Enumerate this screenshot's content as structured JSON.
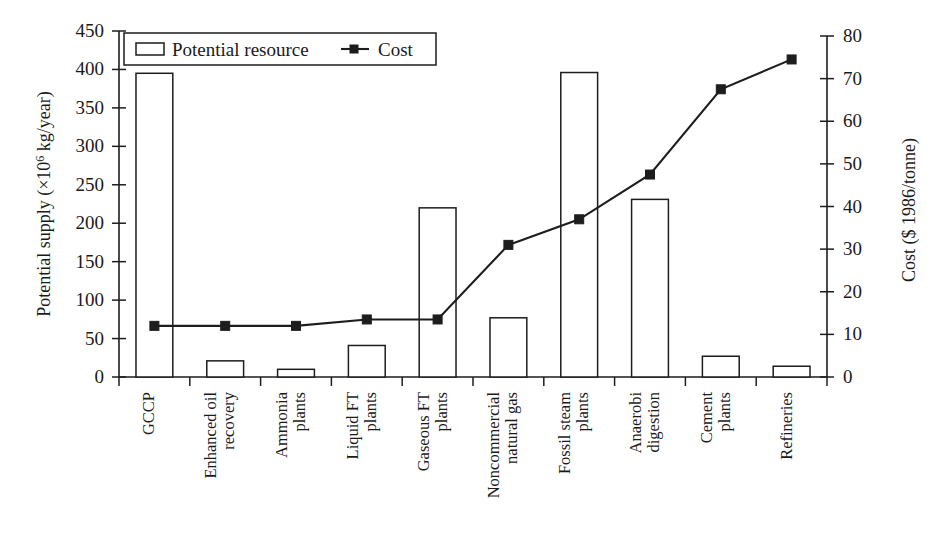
{
  "chart_data": {
    "type": "bar",
    "title": "",
    "subtitle": "",
    "categories": [
      "GCCP",
      "Enhanced oil recovery",
      "Ammonia plants",
      "Liquid FT plants",
      "Gaseous FT plants",
      "Noncommercial natural gas",
      "Fossil steam plants",
      "Anaerobi digestion",
      "Cement plants",
      "Refineries"
    ],
    "category_lines": [
      [
        "GCCP"
      ],
      [
        "Enhanced oil",
        "recovery"
      ],
      [
        "Ammonia",
        "plants"
      ],
      [
        "Liquid FT",
        "plants"
      ],
      [
        "Gaseous FT",
        "plants"
      ],
      [
        "Noncommercial",
        "natural gas"
      ],
      [
        "Fossil steam",
        "plants"
      ],
      [
        "Anaerobi",
        "digestion"
      ],
      [
        "Cement",
        "plants"
      ],
      [
        "Refineries"
      ]
    ],
    "series": [
      {
        "name": "Potential resource",
        "kind": "bar",
        "axis": "left",
        "unit": "x10^6 kg/year",
        "values": [
          395,
          21,
          10,
          41,
          220,
          77,
          396,
          231,
          27,
          14
        ]
      },
      {
        "name": "Cost",
        "kind": "line",
        "axis": "right",
        "unit": "$ 1986/tonne",
        "marker": "square",
        "values": [
          12,
          12,
          12,
          13.5,
          13.5,
          31,
          37,
          47.5,
          67.5,
          74.5
        ]
      }
    ],
    "xlabel": "",
    "ylabel": "Potential supply (×10⁶ kg/year)",
    "y2label": "Cost ($ 1986/tonne)",
    "ylim": [
      0,
      450
    ],
    "y2lim": [
      0,
      80
    ],
    "yticks": [
      0,
      50,
      100,
      150,
      200,
      250,
      300,
      350,
      400,
      450
    ],
    "y2ticks": [
      0,
      10,
      20,
      30,
      40,
      50,
      60,
      70,
      80
    ],
    "grid": false,
    "legend_position": "top-left",
    "legend": [
      "Potential resource",
      "Cost"
    ]
  },
  "axes": {
    "left_title_prefix": "Potential supply (×10",
    "left_title_exp": "6",
    "left_title_suffix": " kg/year)",
    "right_title": "Cost ($ 1986/tonne)"
  },
  "legend": {
    "bar_label": "Potential resource",
    "line_label": "Cost"
  },
  "colors": {
    "ink": "#1d1d1d",
    "background": "#ffffff",
    "bar_fill": "#ffffff",
    "line": "#1d1d1d"
  }
}
